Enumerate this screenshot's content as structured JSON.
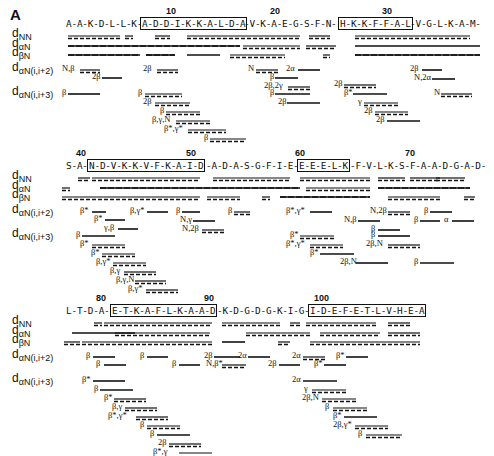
{
  "panel_letter": "A",
  "row_labels": [
    {
      "main": "d",
      "sub": "NN"
    },
    {
      "main": "d",
      "sub": "αN"
    },
    {
      "main": "d",
      "sub": "βN"
    },
    {
      "main": "d",
      "sub": "αN(i,i+2)"
    },
    {
      "main": "d",
      "sub": "αN(i,i+3)"
    }
  ],
  "blocks": [
    {
      "top": 18,
      "sequence_segments": [
        {
          "text": "A-A-K-D-L-L-K-",
          "x": 66,
          "boxed": false
        },
        {
          "text": "A-D-D-I-K-K-A-L-D-A",
          "x": 140,
          "boxed": true,
          "w": 103
        },
        {
          "text": "-V-K-A-E-G-S-F-N-",
          "x": 244,
          "boxed": false
        },
        {
          "text": "H-K-K-F-F-A-L",
          "x": 338,
          "boxed": true,
          "w": 71
        },
        {
          "text": "-V-G-L-K-A-M-",
          "x": 410,
          "boxed": false
        }
      ],
      "numbers": [
        {
          "n": "10",
          "x": 166
        },
        {
          "n": "20",
          "x": 270
        },
        {
          "n": "30",
          "x": 382
        }
      ],
      "lines": {
        "dNN": [
          [
            68,
            120,
            "d"
          ],
          [
            125,
            133,
            "d"
          ],
          [
            155,
            170,
            "d"
          ],
          [
            187,
            300,
            "d"
          ],
          [
            309,
            330,
            "d"
          ],
          [
            355,
            470,
            "d"
          ]
        ],
        "daN": [
          [
            68,
            240,
            "m"
          ],
          [
            243,
            300,
            "d"
          ],
          [
            306,
            336,
            "d"
          ],
          [
            355,
            480,
            "s"
          ]
        ],
        "dbN": [
          [
            68,
            140,
            "m"
          ],
          [
            146,
            175,
            "m"
          ],
          [
            187,
            220,
            "s"
          ],
          [
            230,
            285,
            "d"
          ],
          [
            323,
            330,
            "d"
          ],
          [
            355,
            480,
            "m"
          ]
        ]
      },
      "i2": [
        {
          "label": "N,β",
          "x": 62,
          "y": 0,
          "x1": 80,
          "x2": 100,
          "style": "d"
        },
        {
          "label": "2β",
          "x": 92,
          "y": 8,
          "x1": 102,
          "x2": 122,
          "style": "s"
        },
        {
          "label": "2β",
          "x": 143,
          "y": 0,
          "x1": 157,
          "x2": 178,
          "style": "d"
        },
        {
          "label": "N",
          "x": 248,
          "y": 0,
          "x1": 256,
          "x2": 278,
          "style": "d"
        },
        {
          "label": "2α",
          "x": 286,
          "y": 0,
          "x1": 298,
          "x2": 320,
          "style": "s"
        },
        {
          "label": "β",
          "x": 270,
          "y": 8,
          "x1": 275,
          "x2": 298,
          "style": "s"
        },
        {
          "label": "2β,2γ",
          "x": 264,
          "y": 17,
          "x1": 288,
          "x2": 310,
          "style": "d"
        },
        {
          "label": "2β",
          "x": 410,
          "y": 0,
          "x1": 422,
          "x2": 442,
          "style": "s"
        },
        {
          "label": "N,2α",
          "x": 414,
          "y": 9,
          "x1": 432,
          "x2": 455,
          "style": "s"
        }
      ],
      "i3": [
        {
          "label": "β",
          "x": 62,
          "y": 0,
          "x1": 68,
          "x2": 100,
          "style": "s"
        },
        {
          "label": "β",
          "x": 138,
          "y": 0,
          "x1": 145,
          "x2": 182,
          "style": "d"
        },
        {
          "label": "2β",
          "x": 143,
          "y": 9,
          "x1": 155,
          "x2": 190,
          "style": "d"
        },
        {
          "label": "β",
          "x": 160,
          "y": 18,
          "x1": 166,
          "x2": 200,
          "style": "d"
        },
        {
          "label": "β,γ,N",
          "x": 152,
          "y": 27,
          "x1": 176,
          "x2": 210,
          "style": "d"
        },
        {
          "label": "β*,γ*",
          "x": 164,
          "y": 36,
          "x1": 188,
          "x2": 226,
          "style": "d"
        },
        {
          "label": "β",
          "x": 204,
          "y": 45,
          "x1": 210,
          "x2": 246,
          "style": "d"
        },
        {
          "label": "β",
          "x": 270,
          "y": 0,
          "x1": 275,
          "x2": 310,
          "style": "s"
        },
        {
          "label": "2β",
          "x": 278,
          "y": 9,
          "x1": 287,
          "x2": 320,
          "style": "s"
        },
        {
          "label": "2β",
          "x": 334,
          "y": -9,
          "x1": 344,
          "x2": 376,
          "style": "d"
        },
        {
          "label": "β*",
          "x": 344,
          "y": 0,
          "x1": 353,
          "x2": 387,
          "style": "s"
        },
        {
          "label": "γ",
          "x": 358,
          "y": 9,
          "x1": 364,
          "x2": 398,
          "style": "d"
        },
        {
          "label": "2β",
          "x": 364,
          "y": 18,
          "x1": 375,
          "x2": 408,
          "style": "d"
        },
        {
          "label": "2β",
          "x": 376,
          "y": 27,
          "x1": 387,
          "x2": 420,
          "style": "s"
        },
        {
          "label": "N",
          "x": 434,
          "y": 0,
          "x1": 441,
          "x2": 472,
          "style": "d"
        }
      ]
    },
    {
      "top": 160,
      "sequence_segments": [
        {
          "text": "S-A-",
          "x": 66,
          "boxed": false
        },
        {
          "text": "N-D-V-K-K-V-F-K-A-I-D",
          "x": 87,
          "boxed": true,
          "w": 118
        },
        {
          "text": "-A-D-A-S-G-F-I-E-",
          "x": 206,
          "boxed": false
        },
        {
          "text": "E-E-E-L-K",
          "x": 297,
          "boxed": true,
          "w": 52
        },
        {
          "text": "-F-V-L-K-S-F-A-A-D-G-A-D-",
          "x": 350,
          "boxed": false
        }
      ],
      "numbers": [
        {
          "n": "40",
          "x": 76
        },
        {
          "n": "50",
          "x": 186
        },
        {
          "n": "60",
          "x": 295
        },
        {
          "n": "70",
          "x": 405
        }
      ],
      "lines": {
        "dNN": [
          [
            78,
            90,
            "d"
          ],
          [
            92,
            200,
            "d"
          ],
          [
            213,
            290,
            "d"
          ],
          [
            300,
            370,
            "d"
          ],
          [
            378,
            405,
            "d"
          ],
          [
            410,
            440,
            "d"
          ],
          [
            436,
            465,
            "d"
          ]
        ],
        "daN": [
          [
            62,
            70,
            "d"
          ],
          [
            100,
            300,
            "m"
          ],
          [
            306,
            370,
            "d"
          ],
          [
            378,
            470,
            "m"
          ]
        ],
        "dbN": [
          [
            62,
            200,
            "d"
          ],
          [
            207,
            240,
            "d"
          ],
          [
            262,
            270,
            "d"
          ],
          [
            280,
            370,
            "m"
          ],
          [
            388,
            440,
            "d"
          ],
          [
            464,
            475,
            "d"
          ]
        ]
      },
      "i2": [
        {
          "label": "β*",
          "x": 80,
          "y": 0,
          "x1": 92,
          "x2": 106,
          "style": "s"
        },
        {
          "label": "β*",
          "x": 94,
          "y": 8,
          "x1": 105,
          "x2": 125,
          "style": "s"
        },
        {
          "label": "γ,β",
          "x": 104,
          "y": 17,
          "x1": 118,
          "x2": 138,
          "style": "s"
        },
        {
          "label": "β,γ*",
          "x": 130,
          "y": 0,
          "x1": 147,
          "x2": 168,
          "style": "s"
        },
        {
          "label": "β",
          "x": 176,
          "y": 0,
          "x1": 182,
          "x2": 200,
          "style": "s"
        },
        {
          "label": "β",
          "x": 228,
          "y": 0,
          "x1": 234,
          "x2": 250,
          "style": "d"
        },
        {
          "label": "N,γ",
          "x": 180,
          "y": 9,
          "x1": 193,
          "x2": 215,
          "style": "s"
        },
        {
          "label": "N,2β",
          "x": 182,
          "y": 18,
          "x1": 202,
          "x2": 224,
          "style": "d"
        },
        {
          "label": "β*,γ*",
          "x": 286,
          "y": 0,
          "x1": 310,
          "x2": 332,
          "style": "s"
        },
        {
          "label": "N,β",
          "x": 344,
          "y": 9,
          "x1": 358,
          "x2": 380,
          "style": "s"
        },
        {
          "label": "N,2β",
          "x": 370,
          "y": 0,
          "x1": 388,
          "x2": 410,
          "style": "d"
        },
        {
          "label": "β",
          "x": 371,
          "y": 18,
          "x1": 378,
          "x2": 400,
          "style": "s"
        },
        {
          "label": "β",
          "x": 414,
          "y": 9,
          "x1": 420,
          "x2": 440,
          "style": "s"
        },
        {
          "label": "β",
          "x": 424,
          "y": 0,
          "x1": 430,
          "x2": 452,
          "style": "s"
        },
        {
          "label": "α",
          "x": 444,
          "y": 9,
          "x1": 452,
          "x2": 474,
          "style": "s"
        }
      ],
      "i3": [
        {
          "label": "β",
          "x": 76,
          "y": 0,
          "x1": 82,
          "x2": 115,
          "style": "s"
        },
        {
          "label": "β*",
          "x": 80,
          "y": 9,
          "x1": 92,
          "x2": 125,
          "style": "d"
        },
        {
          "label": "β*",
          "x": 91,
          "y": 18,
          "x1": 102,
          "x2": 135,
          "style": "d"
        },
        {
          "label": "β,γ*",
          "x": 96,
          "y": 27,
          "x1": 113,
          "x2": 146,
          "style": "d"
        },
        {
          "label": "β,γ",
          "x": 110,
          "y": 36,
          "x1": 124,
          "x2": 156,
          "style": "d"
        },
        {
          "label": "β,γ,N",
          "x": 116,
          "y": 45,
          "x1": 135,
          "x2": 166,
          "style": "d"
        },
        {
          "label": "β,γ*",
          "x": 128,
          "y": 54,
          "x1": 146,
          "x2": 178,
          "style": "d"
        },
        {
          "label": "β*",
          "x": 290,
          "y": 0,
          "x1": 300,
          "x2": 334,
          "style": "d"
        },
        {
          "label": "β*,γ*",
          "x": 286,
          "y": 9,
          "x1": 310,
          "x2": 343,
          "style": "d"
        },
        {
          "label": "β*",
          "x": 310,
          "y": 18,
          "x1": 320,
          "x2": 354,
          "style": "s"
        },
        {
          "label": "2β,N",
          "x": 340,
          "y": 27,
          "x1": 356,
          "x2": 388,
          "style": "s"
        },
        {
          "label": "β",
          "x": 371,
          "y": 0,
          "x1": 378,
          "x2": 410,
          "style": "s"
        },
        {
          "label": "2β,N",
          "x": 366,
          "y": 9,
          "x1": 388,
          "x2": 420,
          "style": "d"
        },
        {
          "label": "β",
          "x": 414,
          "y": 27,
          "x1": 420,
          "x2": 454,
          "style": "s"
        }
      ]
    },
    {
      "top": 305,
      "sequence_segments": [
        {
          "text": "L-T-D-A-",
          "x": 66,
          "boxed": false
        },
        {
          "text": "E-T-K-A-F-L-K-A-A-D",
          "x": 110,
          "boxed": true,
          "w": 106
        },
        {
          "text": "-K-D-G-D-G-K-I-G-",
          "x": 217,
          "boxed": false
        },
        {
          "text": "I-D-E-F-E-T-L-V-H-E-A",
          "x": 308,
          "boxed": true,
          "w": 116
        }
      ],
      "numbers": [
        {
          "n": "80",
          "x": 96
        },
        {
          "n": "90",
          "x": 204
        },
        {
          "n": "100",
          "x": 314
        }
      ],
      "lines": {
        "dNN": [
          [
            94,
            102,
            "d"
          ],
          [
            104,
            212,
            "d"
          ],
          [
            222,
            280,
            "d"
          ],
          [
            290,
            300,
            "d"
          ],
          [
            306,
            376,
            "d"
          ],
          [
            388,
            410,
            "d"
          ]
        ],
        "daN": [
          [
            72,
            135,
            "s"
          ],
          [
            115,
            210,
            "d"
          ],
          [
            246,
            310,
            "d"
          ],
          [
            320,
            380,
            "d"
          ],
          [
            388,
            420,
            "d"
          ]
        ],
        "dbN": [
          [
            64,
            80,
            "d"
          ],
          [
            82,
            212,
            "d"
          ],
          [
            222,
            245,
            "s"
          ],
          [
            278,
            290,
            "d"
          ],
          [
            310,
            420,
            "d"
          ]
        ]
      },
      "i2": [
        {
          "label": "β",
          "x": 86,
          "y": 0,
          "x1": 93,
          "x2": 115,
          "style": "s"
        },
        {
          "label": "β",
          "x": 96,
          "y": 8,
          "x1": 104,
          "x2": 126,
          "style": "s"
        },
        {
          "label": "β",
          "x": 140,
          "y": 0,
          "x1": 147,
          "x2": 168,
          "style": "s"
        },
        {
          "label": "β",
          "x": 172,
          "y": 8,
          "x1": 179,
          "x2": 200,
          "style": "s"
        },
        {
          "label": "2β",
          "x": 204,
          "y": 0,
          "x1": 214,
          "x2": 240,
          "style": "s"
        },
        {
          "label": "N,β*",
          "x": 206,
          "y": 8,
          "x1": 222,
          "x2": 246,
          "style": "d"
        },
        {
          "label": "2α",
          "x": 238,
          "y": 0,
          "x1": 248,
          "x2": 270,
          "style": "s"
        },
        {
          "label": "2α",
          "x": 292,
          "y": 0,
          "x1": 303,
          "x2": 325,
          "style": "d"
        },
        {
          "label": "2β",
          "x": 268,
          "y": 8,
          "x1": 279,
          "x2": 300,
          "style": "s"
        },
        {
          "label": "β*",
          "x": 314,
          "y": 8,
          "x1": 324,
          "x2": 346,
          "style": "s"
        },
        {
          "label": "β*",
          "x": 336,
          "y": 0,
          "x1": 346,
          "x2": 368,
          "style": "s"
        }
      ],
      "i3": [
        {
          "label": "β*",
          "x": 82,
          "y": 0,
          "x1": 93,
          "x2": 125,
          "style": "s"
        },
        {
          "label": "β",
          "x": 94,
          "y": 9,
          "x1": 100,
          "x2": 133,
          "style": "s"
        },
        {
          "label": "β*",
          "x": 104,
          "y": 18,
          "x1": 114,
          "x2": 146,
          "style": "d"
        },
        {
          "label": "β,γ",
          "x": 112,
          "y": 27,
          "x1": 125,
          "x2": 157,
          "style": "d"
        },
        {
          "label": "β*,γ*",
          "x": 108,
          "y": 36,
          "x1": 136,
          "x2": 168,
          "style": "d"
        },
        {
          "label": "β",
          "x": 140,
          "y": 45,
          "x1": 147,
          "x2": 180,
          "style": "d"
        },
        {
          "label": "β",
          "x": 150,
          "y": 54,
          "x1": 157,
          "x2": 190,
          "style": "s"
        },
        {
          "label": "2β",
          "x": 158,
          "y": 63,
          "x1": 169,
          "x2": 201,
          "style": "d"
        },
        {
          "label": "β*,γ",
          "x": 153,
          "y": 72,
          "x1": 179,
          "x2": 212,
          "style": "d"
        },
        {
          "label": "2α",
          "x": 292,
          "y": 0,
          "x1": 303,
          "x2": 337,
          "style": "s"
        },
        {
          "label": "γ",
          "x": 304,
          "y": 9,
          "x1": 312,
          "x2": 346,
          "style": "d"
        },
        {
          "label": "2β,N",
          "x": 302,
          "y": 18,
          "x1": 322,
          "x2": 356,
          "style": "d"
        },
        {
          "label": "β",
          "x": 325,
          "y": 27,
          "x1": 333,
          "x2": 367,
          "style": "d"
        },
        {
          "label": "β*",
          "x": 333,
          "y": 36,
          "x1": 344,
          "x2": 377,
          "style": "s"
        },
        {
          "label": "2β,γ*",
          "x": 333,
          "y": 45,
          "x1": 355,
          "x2": 388,
          "style": "d"
        },
        {
          "label": "β",
          "x": 358,
          "y": 54,
          "x1": 366,
          "x2": 402,
          "style": "d"
        }
      ]
    }
  ]
}
